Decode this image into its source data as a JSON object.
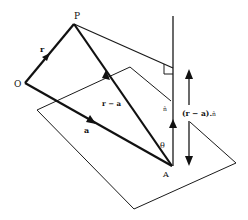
{
  "figure": {
    "points": {
      "O": "O",
      "P": "P",
      "A": "A"
    },
    "vectors": {
      "r": "r",
      "a": "a",
      "r_minus_a": "r − a",
      "normal": "n̂"
    },
    "labels": {
      "angle": "θ",
      "projection_prefix": "(r − a).",
      "projection_suffix": "n̂"
    },
    "colors": {
      "stroke": "#111111",
      "background": "#ffffff"
    }
  }
}
